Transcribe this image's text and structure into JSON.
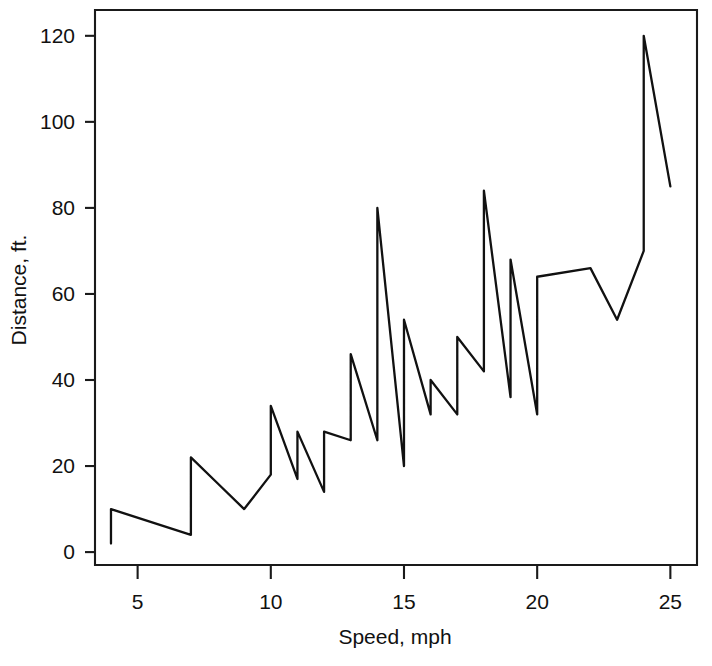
{
  "chart_data": {
    "type": "line",
    "title": "",
    "subtitle": "",
    "xlabel": "Speed, mph",
    "ylabel": "Distance, ft.",
    "xlim": [
      3.4,
      26.0
    ],
    "ylim": [
      -3.0,
      126.0
    ],
    "xticks": [
      5,
      10,
      15,
      20,
      25
    ],
    "yticks": [
      0,
      20,
      40,
      60,
      80,
      100,
      120
    ],
    "grid": false,
    "legend": null,
    "series": [
      {
        "name": "Stopping distance",
        "color": "#111111",
        "x": [
          4,
          4,
          7,
          7,
          8,
          9,
          10,
          10,
          10,
          11,
          11,
          12,
          12,
          12,
          12,
          13,
          13,
          13,
          13,
          14,
          14,
          14,
          14,
          15,
          15,
          15,
          16,
          16,
          17,
          17,
          17,
          18,
          18,
          18,
          18,
          19,
          19,
          19,
          20,
          20,
          20,
          20,
          20,
          22,
          23,
          24,
          24,
          24,
          24,
          25
        ],
        "y": [
          2,
          10,
          4,
          22,
          16,
          10,
          18,
          26,
          34,
          17,
          28,
          14,
          20,
          24,
          28,
          26,
          34,
          34,
          46,
          26,
          36,
          60,
          80,
          20,
          26,
          54,
          32,
          40,
          32,
          40,
          50,
          42,
          56,
          76,
          84,
          36,
          46,
          68,
          32,
          48,
          52,
          56,
          64,
          66,
          54,
          70,
          92,
          93,
          120,
          85
        ]
      }
    ],
    "annotations": []
  },
  "axis": {
    "x_tick_labels": [
      "5",
      "10",
      "15",
      "20",
      "25"
    ],
    "y_tick_labels": [
      "0",
      "20",
      "40",
      "60",
      "80",
      "100",
      "120"
    ],
    "x_title": "Speed, mph",
    "y_title": "Distance, ft."
  },
  "colors": {
    "background": "#ffffff",
    "line": "#111111",
    "axis": "#1a1a1a",
    "text": "#111111"
  }
}
